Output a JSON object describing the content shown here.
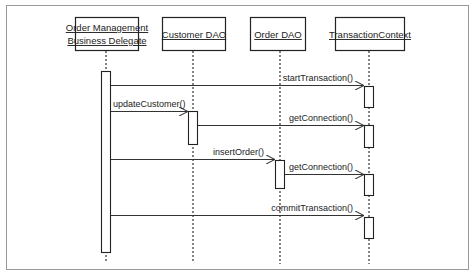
{
  "diagram": {
    "type": "UML sequence diagram",
    "frame_color": "#999999",
    "line_color": "#333333",
    "participants": [
      {
        "id": "ombd",
        "line1": "Order Management",
        "line2": "Business Delegate",
        "x": 106
      },
      {
        "id": "customer_dao",
        "line1": "Customer DAO",
        "line2": "",
        "x": 193
      },
      {
        "id": "order_dao",
        "line1": "Order DAO",
        "line2": "",
        "x": 280
      },
      {
        "id": "tx_context",
        "line1": "TransactionContext",
        "line2": "",
        "x": 369
      }
    ],
    "messages": [
      {
        "from": "ombd",
        "to": "tx_context",
        "label": "startTransaction()",
        "y": 85
      },
      {
        "from": "ombd",
        "to": "customer_dao",
        "label": "updateCustomer()",
        "y": 111
      },
      {
        "from": "customer_dao",
        "to": "tx_context",
        "label": "getConnection()",
        "y": 125
      },
      {
        "from": "ombd",
        "to": "order_dao",
        "label": "insertOrder()",
        "y": 159
      },
      {
        "from": "order_dao",
        "to": "tx_context",
        "label": "getConnection()",
        "y": 174
      },
      {
        "from": "ombd",
        "to": "tx_context",
        "label": "commitTransaction()",
        "y": 215
      }
    ]
  }
}
